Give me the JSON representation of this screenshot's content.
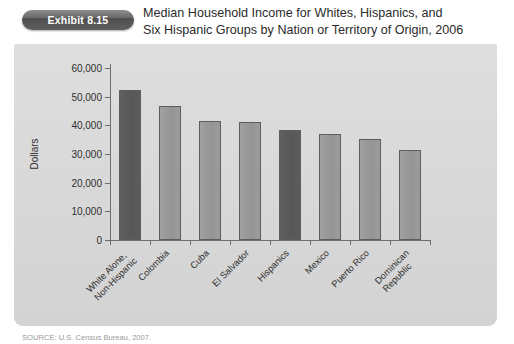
{
  "exhibit": {
    "badge_label": "Exhibit 8.15",
    "title_line1": "Median Household Income for Whites, Hispanics, and",
    "title_line2": "Six Hispanic Groups by Nation or Territory of Origin, 2006"
  },
  "source": {
    "text": "SOURCE: U.S. Census Bureau, 2007."
  },
  "colors": {
    "panel_background": "#d7d7d7",
    "bar_light": "#9a9a9a",
    "bar_dark": "#595959",
    "bar_border": "#5d5d5d",
    "axis": "#6e6e6e",
    "badge": "#5e5e5e",
    "text": "#2b2b2b"
  },
  "chart_data": {
    "type": "bar",
    "title": "Median Household Income for Whites, Hispanics, and Six Hispanic Groups by Nation or Territory of Origin, 2006",
    "xlabel": "",
    "ylabel": "Dollars",
    "ylim": [
      0,
      60000
    ],
    "ytick_values": [
      0,
      10000,
      20000,
      30000,
      40000,
      50000,
      60000
    ],
    "ytick_labels": [
      "0",
      "10,000",
      "20,000",
      "30,000",
      "40,000",
      "50,000",
      "60,000"
    ],
    "grid": false,
    "legend": "none",
    "categories": [
      "White Alone, Non-Hispanic",
      "Colombia",
      "Cuba",
      "El Salvador",
      "Hispanics",
      "Mexico",
      "Puerto Rico",
      "Dominican Republic"
    ],
    "category_lines": [
      [
        "White Alone,",
        "Non-Hispanic"
      ],
      [
        "Colombia"
      ],
      [
        "Cuba"
      ],
      [
        "El Salvador"
      ],
      [
        "Hispanics"
      ],
      [
        "Mexico"
      ],
      [
        "Puerto Rico"
      ],
      [
        "Dominican",
        "Republic"
      ]
    ],
    "values": [
      52400,
      46800,
      41500,
      41300,
      38300,
      37000,
      35100,
      31300
    ],
    "highlight": [
      true,
      false,
      false,
      false,
      true,
      false,
      false,
      false
    ]
  }
}
